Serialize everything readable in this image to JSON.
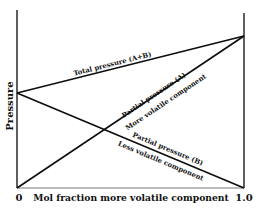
{
  "diagram": {
    "type": "vapor-pressure-composition diagram",
    "y_axis_label": "Pressure",
    "x_axis_label": "Mol fraction more volatile component",
    "x_ticks": [
      "0",
      "1.0"
    ],
    "lines": {
      "total": {
        "label": "Total pressure (A+B)"
      },
      "partial_a": {
        "label_top": "Partial pressure (A)",
        "label_bottom": "More volatile component"
      },
      "partial_b": {
        "label_top": "Partial pressure (B)",
        "label_bottom": "Less volatile component"
      }
    }
  },
  "colors": {
    "line": "#0d0d0d",
    "background": "#ffffff"
  }
}
